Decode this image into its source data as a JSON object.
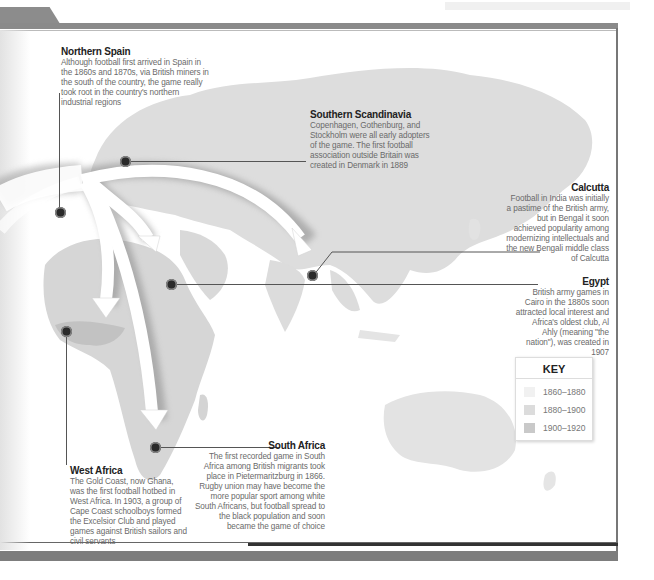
{
  "map": {
    "locations": [
      {
        "id": "northern-spain",
        "title": "Northern Spain",
        "text": "Although football first arrived in Spain in the 1860s and 1870s, via British miners in the south of the country, the game really took root in the country's northern industrial regions"
      },
      {
        "id": "southern-scandinavia",
        "title": "Southern Scandinavia",
        "text": "Copenhagen, Gothenburg, and Stockholm were all early adopters of the game. The first football association outside Britain was created in Denmark in 1889"
      },
      {
        "id": "calcutta",
        "title": "Calcutta",
        "text": "Football in India was initially a pastime of the British army, but in Bengal it soon achieved popularity among modernizing intellectuals and the new Bengali middle class of Calcutta"
      },
      {
        "id": "egypt",
        "title": "Egypt",
        "text": "British army games in Cairo in the 1880s soon attracted local interest and Africa's oldest club, Al Ahly (meaning \"the nation\"), was created in 1907"
      },
      {
        "id": "west-africa",
        "title": "West Africa",
        "text": "The Gold Coast, now Ghana, was the first football hotbed in West Africa. In 1903, a group of Cape Coast schoolboys formed the Excelsior Club and played games against British sailors and civil servants"
      },
      {
        "id": "south-africa",
        "title": "South Africa",
        "text": "The first recorded game in South Africa among British migrants took place in Pietermaritzburg in 1866. Rugby union may have become the more popular sport among white South Africans, but football spread to the black population and soon became the game of choice"
      }
    ]
  },
  "key": {
    "title": "KEY",
    "items": [
      {
        "label": "1860–1880",
        "color": "#f1f1f1"
      },
      {
        "label": "1880–1900",
        "color": "#dcdcdc"
      },
      {
        "label": "1900–1920",
        "color": "#c9c9c9"
      }
    ]
  },
  "colors": {
    "land": "#dedede",
    "frame": "#808080",
    "marker": "#2a2a2a"
  }
}
